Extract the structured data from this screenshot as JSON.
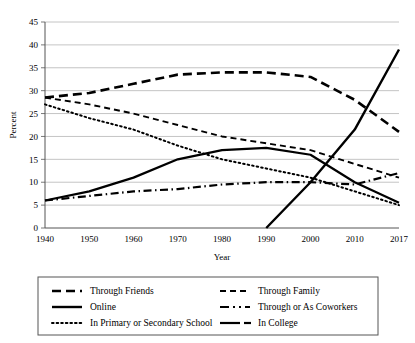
{
  "chart_data": {
    "type": "line",
    "title": "",
    "xlabel": "Year",
    "ylabel": "Percent",
    "grid": true,
    "legend_position": "bottom",
    "xlim": [
      1940,
      2017
    ],
    "ylim": [
      0,
      45
    ],
    "yticks": [
      0,
      5,
      10,
      15,
      20,
      25,
      30,
      35,
      40,
      45
    ],
    "xticks": [
      1940,
      1950,
      1960,
      1970,
      1980,
      1990,
      2000,
      2010,
      2017
    ],
    "x": [
      1940,
      1950,
      1960,
      1970,
      1980,
      1990,
      2000,
      2010,
      2017
    ],
    "series": [
      {
        "name": "Through Friends",
        "style": "dashed-long",
        "values": [
          28.5,
          29.5,
          31.5,
          33.5,
          34.0,
          34.0,
          33.0,
          28.0,
          21.0
        ]
      },
      {
        "name": "Through Family",
        "style": "dashed-short",
        "values": [
          28.5,
          27.0,
          25.0,
          22.5,
          20.0,
          18.5,
          17.0,
          14.0,
          11.0
        ]
      },
      {
        "name": "Online",
        "style": "solid-thick",
        "values": [
          0,
          0,
          0,
          0,
          0,
          0,
          10.0,
          21.5,
          39.0
        ]
      },
      {
        "name": "Through or As Coworkers",
        "style": "dash-dot",
        "values": [
          6.0,
          7.0,
          8.0,
          8.5,
          9.5,
          10.0,
          10.0,
          9.5,
          12.0
        ]
      },
      {
        "name": "In Primary or Secondary School",
        "style": "dotted",
        "values": [
          27.0,
          24.0,
          21.5,
          18.0,
          15.0,
          13.0,
          11.0,
          8.0,
          5.0
        ]
      },
      {
        "name": "In College",
        "style": "solid-dash",
        "values": [
          6.0,
          8.0,
          11.0,
          15.0,
          17.0,
          17.5,
          16.0,
          10.0,
          5.5
        ]
      }
    ]
  },
  "legend": {
    "items": [
      {
        "label": "Through Friends",
        "style": "dashed-long"
      },
      {
        "label": "Through Family",
        "style": "dashed-short"
      },
      {
        "label": "Online",
        "style": "solid-thick"
      },
      {
        "label": "Through or As Coworkers",
        "style": "dash-dot"
      },
      {
        "label": "In Primary or Secondary School",
        "style": "dotted"
      },
      {
        "label": "In College",
        "style": "solid-dash"
      }
    ]
  },
  "colors": {
    "line": "#000000",
    "grid": "#b5b5b5",
    "axis": "#555555",
    "background": "#ffffff"
  }
}
